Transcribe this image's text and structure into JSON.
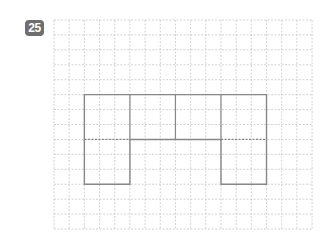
{
  "problem": {
    "number": "25"
  },
  "grid": {
    "origin": [
      54,
      20
    ],
    "cell_width": 15.18,
    "cell_height": 14.93,
    "columns": 17,
    "rows": 14,
    "line_color": "#c8c8c8"
  },
  "shape": {
    "description": "Net of a solid: four squares in a row (2x2 each) with two squares hanging below the ends",
    "stroke_color": "#888888",
    "outline_cells": [
      [
        2,
        5
      ],
      [
        14,
        5
      ],
      [
        14,
        11
      ],
      [
        11,
        11
      ],
      [
        11,
        8
      ],
      [
        5,
        8
      ],
      [
        5,
        11
      ],
      [
        2,
        11
      ]
    ],
    "solid_internal": [
      [
        [
          5,
          5
        ],
        [
          5,
          8
        ]
      ],
      [
        [
          8,
          5
        ],
        [
          8,
          8
        ]
      ],
      [
        [
          11,
          5
        ],
        [
          11,
          8
        ]
      ]
    ],
    "fold_lines": [
      [
        [
          2,
          8
        ],
        [
          5,
          8
        ]
      ],
      [
        [
          11,
          8
        ],
        [
          14,
          8
        ]
      ]
    ]
  }
}
